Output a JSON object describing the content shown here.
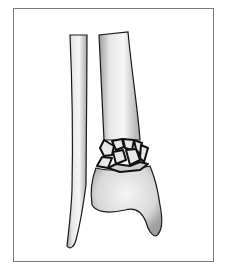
{
  "figure": {
    "colors": {
      "frame_border": "#7a7a7a",
      "background": "#ffffff",
      "bone_fill": "#efefef",
      "bone_shadow": "#bdbdbd",
      "outline": "#1a1a1a"
    }
  }
}
